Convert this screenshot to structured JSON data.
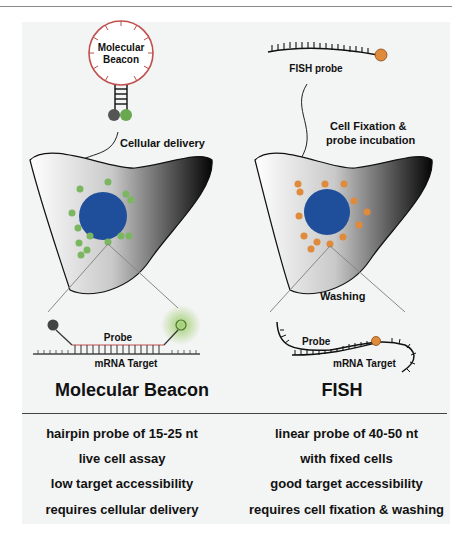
{
  "left": {
    "title": "Molecular Beacon",
    "beacon_label_line1": "Molecular",
    "beacon_label_line2": "Beacon",
    "step_label": "Cellular delivery",
    "probe_label": "Probe",
    "target_label": "mRNA Target",
    "dot_color": "#7bb661",
    "properties": [
      "hairpin probe of 15-25 nt",
      "live cell assay",
      "low target accessibility",
      "requires cellular delivery"
    ]
  },
  "right": {
    "title": "FISH",
    "probe_name": "FISH probe",
    "step_label_line1": "Cell Fixation &",
    "step_label_line2": "probe incubation",
    "wash_label": "Washing",
    "probe_label": "Probe",
    "target_label": "mRNA Target",
    "dot_color": "#e08a3c",
    "properties": [
      "linear probe of 40-50 nt",
      "with fixed cells",
      "good target accessibility",
      "requires cell fixation & washing"
    ]
  },
  "colors": {
    "nucleus": "#1f4e9a",
    "beacon_loop": "#c0504d",
    "background": "#f3f4f4"
  }
}
